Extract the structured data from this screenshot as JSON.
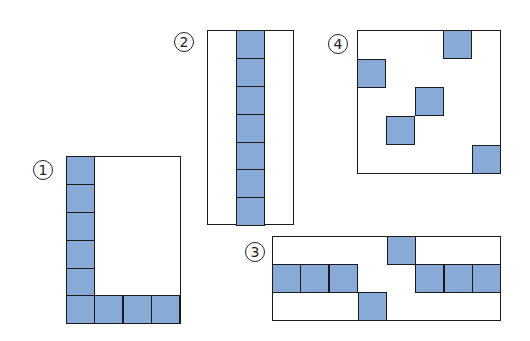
{
  "figures": [
    {
      "id": 1,
      "label": "①",
      "box": {
        "x": 66,
        "y": 156,
        "w": 115,
        "h": 168
      },
      "label_pos": {
        "x": 33,
        "y": 160
      },
      "cells": [
        [
          66,
          156
        ],
        [
          66,
          184
        ],
        [
          66,
          212
        ],
        [
          66,
          240
        ],
        [
          66,
          268
        ],
        [
          66,
          295
        ],
        [
          94,
          295
        ],
        [
          123,
          295
        ],
        [
          151,
          295
        ]
      ]
    },
    {
      "id": 2,
      "label": "②",
      "box": {
        "x": 207,
        "y": 30,
        "w": 87,
        "h": 195
      },
      "label_pos": {
        "x": 174,
        "y": 32
      },
      "cells": [
        [
          236,
          30
        ],
        [
          236,
          58
        ],
        [
          236,
          86
        ],
        [
          236,
          114
        ],
        [
          236,
          142
        ],
        [
          236,
          169
        ],
        [
          236,
          197
        ]
      ]
    },
    {
      "id": 3,
      "label": "③",
      "box": {
        "x": 272,
        "y": 236,
        "w": 229,
        "h": 85
      },
      "label_pos": {
        "x": 245,
        "y": 242
      },
      "cells": [
        [
          387,
          236
        ],
        [
          272,
          264
        ],
        [
          300,
          264
        ],
        [
          329,
          264
        ],
        [
          415,
          264
        ],
        [
          444,
          264
        ],
        [
          472,
          264
        ],
        [
          358,
          292
        ]
      ]
    },
    {
      "id": 4,
      "label": "④",
      "box": {
        "x": 357,
        "y": 30,
        "w": 144,
        "h": 144
      },
      "label_pos": {
        "x": 328,
        "y": 34
      },
      "cells": [
        [
          443,
          30
        ],
        [
          357,
          59
        ],
        [
          415,
          87
        ],
        [
          386,
          116
        ],
        [
          472,
          145
        ]
      ]
    }
  ],
  "cell_size": 29,
  "colors": {
    "fill": "#88aad6",
    "stroke": "#1a1a1a"
  }
}
